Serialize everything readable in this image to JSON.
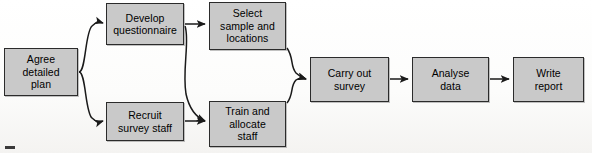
{
  "figure": {
    "type": "flowchart",
    "background_color": "#fdfdfc",
    "node_fill_color": "#c9c9c9",
    "node_border_color": "#2b2b2b",
    "connector_color": "#1a1a1a"
  },
  "nodes": [
    {
      "id": "agree-detailed-plan",
      "label": "Agree\ndetailed\nplan",
      "x": 4,
      "y": 48,
      "width": 74,
      "height": 48
    },
    {
      "id": "develop-questionnaire",
      "label": "Develop\nquestionnaire",
      "x": 106,
      "y": 3,
      "width": 78,
      "height": 42
    },
    {
      "id": "select-sample-and-locations",
      "label": "Select\nsample and\nlocations",
      "x": 209,
      "y": 2,
      "width": 77,
      "height": 48
    },
    {
      "id": "recruit-survey-staff",
      "label": "Recruit\nsurvey staff",
      "x": 106,
      "y": 102,
      "width": 78,
      "height": 39
    },
    {
      "id": "train-and-allocate-staff",
      "label": "Train and\nallocate\nstaff",
      "x": 209,
      "y": 101,
      "width": 77,
      "height": 46
    },
    {
      "id": "carry-out-survey",
      "label": "Carry out\nsurvey",
      "x": 310,
      "y": 57,
      "width": 79,
      "height": 45
    },
    {
      "id": "analyse-data",
      "label": "Analyse\ndata",
      "x": 412,
      "y": 57,
      "width": 77,
      "height": 45
    },
    {
      "id": "write-report",
      "label": "Write\nreport",
      "x": 513,
      "y": 57,
      "width": 71,
      "height": 45
    }
  ],
  "connectors": [
    {
      "id": "plan-to-develop",
      "from": "agree-detailed-plan",
      "to": "develop-questionnaire",
      "style": "curve",
      "path": "M 79 72 C 86 72 85 32 92 26 C 97 21 100 22 103 23"
    },
    {
      "id": "plan-to-recruit",
      "from": "agree-detailed-plan",
      "to": "recruit-survey-staff",
      "style": "curve",
      "path": "M 79 72 C 86 72 85 112 92 118 C 97 123 100 122 103 121"
    },
    {
      "id": "develop-to-select",
      "from": "develop-questionnaire",
      "to": "select-sample-and-locations",
      "style": "straight",
      "path": "M 185 24 L 205 24"
    },
    {
      "id": "develop-to-train",
      "from": "develop-questionnaire",
      "to": "train-and-allocate-staff",
      "style": "curve",
      "path": "M 185 26 C 190 40 182 70 186 94 C 190 112 198 118 205 121"
    },
    {
      "id": "recruit-to-train",
      "from": "recruit-survey-staff",
      "to": "train-and-allocate-staff",
      "style": "straight",
      "path": "M 185 121 L 205 121"
    },
    {
      "id": "select-to-carry-out",
      "from": "select-sample-and-locations",
      "to": "carry-out-survey",
      "style": "curve",
      "path": "M 287 48 C 294 58 290 66 296 73 C 300 77 303 78 306 79"
    },
    {
      "id": "train-to-carry-out",
      "from": "train-and-allocate-staff",
      "to": "carry-out-survey",
      "style": "curve",
      "path": "M 287 103 C 294 94 290 86 296 80 C 300 77 303 78 306 79"
    },
    {
      "id": "carry-out-to-analyse",
      "from": "carry-out-survey",
      "to": "analyse-data",
      "style": "straight",
      "path": "M 390 79 L 408 79"
    },
    {
      "id": "analyse-to-write",
      "from": "analyse-data",
      "to": "write-report",
      "style": "straight",
      "path": "M 490 79 L 509 79"
    }
  ]
}
